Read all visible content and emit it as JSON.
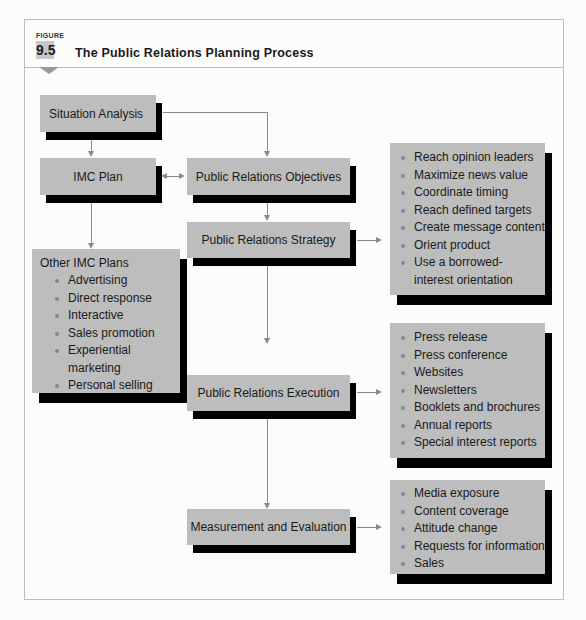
{
  "figure": {
    "label": "FIGURE",
    "number": "9.5",
    "title": "The Public Relations Planning Process"
  },
  "nodes": {
    "situation_analysis": "Situation Analysis",
    "imc_plan": "IMC Plan",
    "pr_objectives": "Public Relations Objectives",
    "pr_strategy": "Public Relations Strategy",
    "pr_execution": "Public Relations Execution",
    "measurement": "Measurement and Evaluation",
    "other_imc": {
      "title": "Other IMC Plans",
      "items": [
        "Advertising",
        "Direct response",
        "Interactive",
        "Sales promotion",
        "Experiential marketing",
        "Personal selling"
      ]
    },
    "strategy_list": {
      "items": [
        "Reach opinion leaders",
        "Maximize news value",
        "Coordinate timing",
        "Reach defined targets",
        "Create message content",
        "Orient product",
        "Use a borrowed-interest orientation"
      ]
    },
    "execution_list": {
      "items": [
        "Press release",
        "Press conference",
        "Websites",
        "Newsletters",
        "Booklets and brochures",
        "Annual reports",
        "Special interest reports"
      ]
    },
    "measurement_list": {
      "items": [
        "Media exposure",
        "Content coverage",
        "Attitude change",
        "Requests for information",
        "Sales"
      ]
    }
  },
  "colors": {
    "box_fill": "#bdbdbd",
    "box_shadow": "#000000",
    "connector": "#8a8a8a"
  }
}
